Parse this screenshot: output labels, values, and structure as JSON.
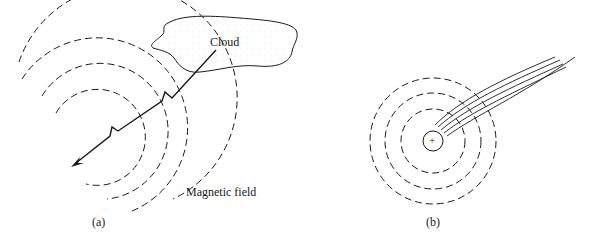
{
  "figure": {
    "panel_a": {
      "caption": "(a)",
      "cloud_label": "Cloud",
      "field_label": "Magnetic field",
      "elements": [
        "cloud",
        "lightning-stroke-with-arrow",
        "magnetic-field-arcs"
      ]
    },
    "panel_b": {
      "caption": "(b)",
      "center_symbol": "+",
      "elements": [
        "charge-circle",
        "concentric-dashed-field-circles",
        "streak-lines"
      ]
    }
  },
  "colors": {
    "ink": "#1a1a1a",
    "background": "#ffffff",
    "cloud_stipple": "#c8c8c8"
  }
}
